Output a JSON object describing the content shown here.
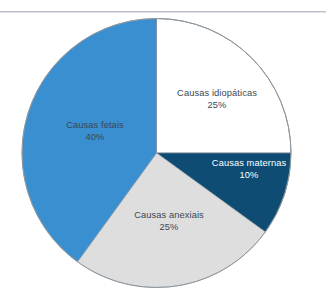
{
  "page": {
    "background_color": "#ffffff",
    "rule_color": "#b9bfc4"
  },
  "chart_data": {
    "type": "pie",
    "title": "",
    "subtitle": "",
    "xlabel": "",
    "ylabel": "",
    "legend_position": "none",
    "grid": false,
    "labels_inside": true,
    "start_angle_deg": 0,
    "direction": "clockwise",
    "categories": [
      "Causas idiopáticas",
      "Causas maternas",
      "Causas anexiais",
      "Causas fetais"
    ],
    "values": [
      25,
      10,
      25,
      40
    ],
    "value_unit": "%",
    "colors": [
      "#ffffff",
      "#0e4c74",
      "#dedede",
      "#3a8fd0"
    ],
    "label_text_colors": [
      "#3d4650",
      "#ffffff",
      "#3d4650",
      "#3d4650"
    ],
    "outline_color": "#8e979e",
    "slices": [
      {
        "name": "Causas idiopáticas",
        "value": 25,
        "value_label": "25%",
        "color": "#ffffff",
        "start_deg": 0,
        "end_deg": 90
      },
      {
        "name": "Causas maternas",
        "value": 10,
        "value_label": "10%",
        "color": "#0e4c74",
        "start_deg": 90,
        "end_deg": 126
      },
      {
        "name": "Causas anexiais",
        "value": 25,
        "value_label": "25%",
        "color": "#dedede",
        "start_deg": 126,
        "end_deg": 216
      },
      {
        "name": "Causas fetais",
        "value": 40,
        "value_label": "40%",
        "color": "#3a8fd0",
        "start_deg": 216,
        "end_deg": 360
      }
    ]
  }
}
